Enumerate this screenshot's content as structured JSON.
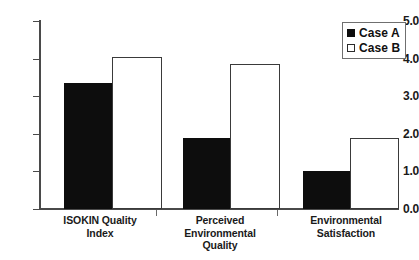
{
  "chart_data": {
    "type": "bar",
    "title": "",
    "xlabel": "",
    "ylabel": "",
    "ylim": [
      0.0,
      5.0
    ],
    "ytick_labels": [
      "0.0",
      "1.0",
      "2.0",
      "3.0",
      "4.0",
      "5.0"
    ],
    "ytick_values": [
      0.0,
      1.0,
      2.0,
      3.0,
      4.0,
      5.0
    ],
    "grid": false,
    "legend_position": "top-right",
    "categories": [
      "ISOKIN Quality Index",
      "Perceived Environmental Quality",
      "Environmental Satisfaction"
    ],
    "category_lines": [
      [
        "ISOKIN Quality",
        "Index"
      ],
      [
        "Perceived",
        "Environmental",
        "Quality"
      ],
      [
        "Environmental",
        "Satisfaction"
      ]
    ],
    "series": [
      {
        "name": "Case A",
        "color": "#0d0d0d",
        "fill": "solid",
        "values": [
          3.35,
          1.9,
          1.0
        ]
      },
      {
        "name": "Case B",
        "color": "#ffffff",
        "fill": "outline",
        "values": [
          4.05,
          3.85,
          1.9
        ]
      }
    ]
  },
  "legend": {
    "items": [
      {
        "label": "Case A",
        "style": "filled"
      },
      {
        "label": "Case B",
        "style": "hollow"
      }
    ]
  },
  "axis": {
    "y_labels": [
      "5.0",
      "4.0",
      "3.0",
      "2.0",
      "1.0",
      "0.0"
    ]
  }
}
